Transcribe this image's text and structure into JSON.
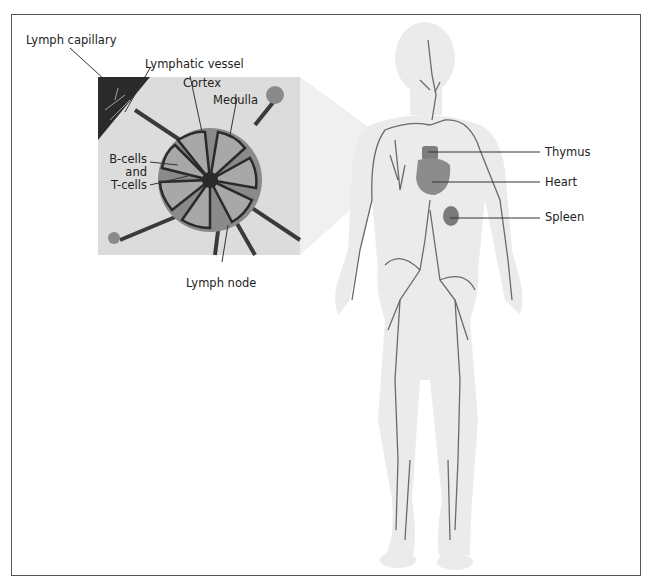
{
  "figure": {
    "title_fragment": "Lymphatic system",
    "inset_labels": {
      "lymph_capillary": "Lymph capillary",
      "lymphatic_vessel": "Lymphatic vessel",
      "cortex": "Cortex",
      "medulla": "Medulla",
      "bcells_line1": "B-cells",
      "bcells_line2": "and",
      "bcells_line3": "T-cells",
      "lymph_node": "Lymph node"
    },
    "body_labels": {
      "thymus": "Thymus",
      "heart": "Heart",
      "spleen": "Spleen"
    },
    "colors": {
      "frame": "#555555",
      "body_fill": "#ebebeb",
      "vessel": "#6a6a6a",
      "organ": "#8c8c8c",
      "node_outer": "#8a8a8a",
      "node_lobe": "#9e9e9e",
      "dark": "#2a2a2a"
    }
  }
}
